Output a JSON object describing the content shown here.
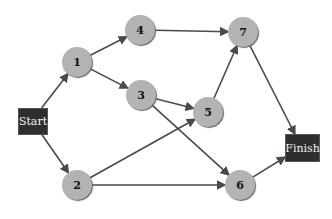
{
  "diagram": {
    "type": "network-activity-diagram",
    "colors": {
      "node_fill": "#b3b3b3",
      "terminal_fill": "#2e2e2e",
      "edge": "#4a4a4a",
      "terminal_text": "#f2f2f2"
    },
    "terminals": [
      {
        "id": "start",
        "label": "Start",
        "x": 18,
        "y": 108,
        "w": 28,
        "h": 25
      },
      {
        "id": "finish",
        "label": "Finish",
        "x": 285,
        "y": 134,
        "w": 33,
        "h": 26
      }
    ],
    "nodes": [
      {
        "id": "1",
        "label": "1",
        "cx": 77,
        "cy": 62
      },
      {
        "id": "2",
        "label": "2",
        "cx": 77,
        "cy": 185
      },
      {
        "id": "3",
        "label": "3",
        "cx": 141,
        "cy": 95
      },
      {
        "id": "4",
        "label": "4",
        "cx": 140,
        "cy": 30
      },
      {
        "id": "5",
        "label": "5",
        "cx": 208,
        "cy": 112
      },
      {
        "id": "6",
        "label": "6",
        "cx": 240,
        "cy": 185
      },
      {
        "id": "7",
        "label": "7",
        "cx": 243,
        "cy": 32
      }
    ],
    "edges": [
      {
        "from": "start",
        "to": "1"
      },
      {
        "from": "start",
        "to": "2"
      },
      {
        "from": "1",
        "to": "4"
      },
      {
        "from": "1",
        "to": "3"
      },
      {
        "from": "4",
        "to": "7"
      },
      {
        "from": "3",
        "to": "5"
      },
      {
        "from": "3",
        "to": "6"
      },
      {
        "from": "2",
        "to": "5"
      },
      {
        "from": "2",
        "to": "6"
      },
      {
        "from": "5",
        "to": "7"
      },
      {
        "from": "7",
        "to": "finish"
      },
      {
        "from": "6",
        "to": "finish"
      }
    ]
  }
}
